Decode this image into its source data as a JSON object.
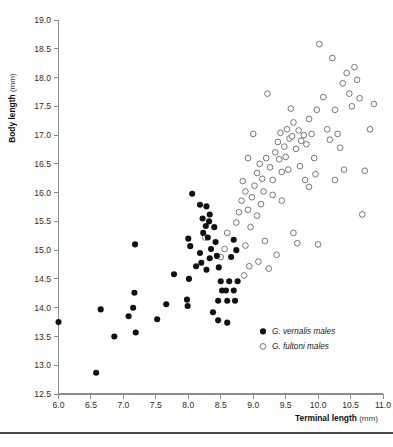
{
  "figure": {
    "background": "#ffffff",
    "point_color_filled": "#111111",
    "point_color_open_stroke": "#6f6f6f",
    "axis_color": "#8d8d8d"
  },
  "axes": {
    "y_title_bold": "Body length",
    "y_title_unit": "(mm)",
    "x_title_bold": "Terminal length",
    "x_title_unit": "(mm)",
    "y_ticks": [
      "19.0",
      "18.5",
      "18.0",
      "17.5",
      "17.0",
      "16.5",
      "16.0",
      "15.5",
      "15.0",
      "14.5",
      "14.0",
      "13.5",
      "13.0",
      "12.5"
    ],
    "x_ticks": [
      "6.0",
      "6.5",
      "7.0",
      "7.5",
      "8.0",
      "8.5",
      "9.0",
      "9.5",
      "10.0",
      "10.5",
      "11.0"
    ]
  },
  "legend": {
    "items": [
      {
        "marker": "filled-circle",
        "genus": "G. vernalis",
        "suffix": "males"
      },
      {
        "marker": "open-circle",
        "genus": "G. fultoni",
        "suffix": "males"
      }
    ]
  },
  "chart_data": {
    "type": "scatter",
    "title": "",
    "xlabel": "Terminal length (mm)",
    "ylabel": "Body length (mm)",
    "xlim": [
      6.0,
      11.0
    ],
    "ylim": [
      12.5,
      19.0
    ],
    "grid": false,
    "legend_position": "bottom-right",
    "series": [
      {
        "name": "G. vernalis males",
        "marker": "filled-circle",
        "points": [
          [
            6.0,
            13.75
          ],
          [
            6.58,
            12.87
          ],
          [
            6.65,
            13.97
          ],
          [
            6.86,
            13.5
          ],
          [
            7.08,
            13.85
          ],
          [
            7.15,
            14.0
          ],
          [
            7.17,
            14.26
          ],
          [
            7.18,
            15.1
          ],
          [
            7.19,
            13.57
          ],
          [
            7.52,
            13.8
          ],
          [
            7.66,
            14.06
          ],
          [
            7.78,
            14.58
          ],
          [
            7.98,
            14.14
          ],
          [
            7.99,
            14.03
          ],
          [
            8.01,
            14.5
          ],
          [
            8.0,
            15.2
          ],
          [
            8.03,
            15.07
          ],
          [
            8.06,
            15.98
          ],
          [
            8.18,
            15.79
          ],
          [
            8.28,
            15.76
          ],
          [
            8.22,
            15.55
          ],
          [
            8.27,
            15.42
          ],
          [
            8.23,
            15.3
          ],
          [
            8.18,
            14.95
          ],
          [
            8.2,
            14.78
          ],
          [
            8.12,
            14.72
          ],
          [
            8.33,
            15.62
          ],
          [
            8.32,
            15.5
          ],
          [
            8.3,
            15.22
          ],
          [
            8.35,
            15.02
          ],
          [
            8.33,
            14.86
          ],
          [
            8.28,
            14.66
          ],
          [
            8.4,
            15.4
          ],
          [
            8.42,
            15.14
          ],
          [
            8.44,
            14.9
          ],
          [
            8.47,
            14.7
          ],
          [
            8.5,
            14.46
          ],
          [
            8.52,
            14.3
          ],
          [
            8.46,
            14.12
          ],
          [
            8.58,
            14.3
          ],
          [
            8.6,
            14.12
          ],
          [
            8.63,
            14.46
          ],
          [
            8.7,
            14.3
          ],
          [
            8.72,
            14.12
          ],
          [
            8.76,
            14.46
          ],
          [
            8.38,
            13.92
          ],
          [
            8.46,
            13.78
          ],
          [
            8.6,
            13.74
          ],
          [
            8.74,
            15.0
          ],
          [
            8.7,
            15.18
          ],
          [
            8.66,
            14.88
          ]
        ]
      },
      {
        "name": "G. fultoni males",
        "marker": "open-circle",
        "points": [
          [
            8.26,
            15.22
          ],
          [
            8.56,
            15.02
          ],
          [
            8.5,
            14.88
          ],
          [
            8.6,
            15.3
          ],
          [
            8.74,
            15.48
          ],
          [
            8.78,
            15.66
          ],
          [
            8.82,
            15.86
          ],
          [
            8.88,
            16.02
          ],
          [
            8.84,
            16.2
          ],
          [
            8.92,
            15.7
          ],
          [
            8.98,
            15.92
          ],
          [
            9.02,
            16.12
          ],
          [
            9.06,
            16.34
          ],
          [
            9.1,
            16.5
          ],
          [
            9.14,
            16.24
          ],
          [
            9.16,
            16.02
          ],
          [
            9.12,
            15.8
          ],
          [
            9.2,
            16.6
          ],
          [
            9.26,
            16.44
          ],
          [
            9.3,
            16.22
          ],
          [
            9.34,
            16.7
          ],
          [
            9.38,
            16.88
          ],
          [
            9.42,
            17.04
          ],
          [
            9.4,
            16.58
          ],
          [
            9.44,
            16.36
          ],
          [
            9.48,
            16.8
          ],
          [
            9.52,
            17.1
          ],
          [
            9.56,
            16.94
          ],
          [
            9.5,
            16.62
          ],
          [
            9.54,
            16.4
          ],
          [
            9.58,
            17.46
          ],
          [
            9.62,
            17.22
          ],
          [
            9.6,
            16.98
          ],
          [
            9.66,
            16.76
          ],
          [
            9.7,
            17.08
          ],
          [
            9.74,
            16.9
          ],
          [
            9.78,
            17.0
          ],
          [
            9.82,
            16.84
          ],
          [
            9.86,
            17.28
          ],
          [
            9.9,
            17.02
          ],
          [
            9.94,
            16.6
          ],
          [
            9.96,
            16.32
          ],
          [
            10.02,
            18.58
          ],
          [
            10.08,
            17.66
          ],
          [
            10.14,
            17.1
          ],
          [
            10.18,
            16.92
          ],
          [
            10.22,
            18.34
          ],
          [
            10.3,
            17.02
          ],
          [
            10.34,
            16.78
          ],
          [
            10.38,
            17.9
          ],
          [
            10.44,
            18.08
          ],
          [
            10.48,
            17.72
          ],
          [
            10.52,
            17.5
          ],
          [
            10.56,
            18.18
          ],
          [
            10.6,
            17.96
          ],
          [
            10.64,
            17.64
          ],
          [
            10.68,
            15.62
          ],
          [
            10.72,
            16.38
          ],
          [
            10.8,
            17.1
          ],
          [
            10.86,
            17.54
          ],
          [
            9.22,
            17.72
          ],
          [
            9.0,
            17.02
          ],
          [
            8.92,
            16.6
          ],
          [
            9.98,
            17.44
          ],
          [
            10.26,
            17.44
          ],
          [
            9.3,
            15.96
          ],
          [
            9.44,
            15.86
          ],
          [
            9.06,
            15.6
          ],
          [
            8.96,
            15.4
          ],
          [
            9.18,
            15.16
          ],
          [
            9.62,
            15.3
          ],
          [
            9.68,
            15.12
          ],
          [
            10.0,
            15.1
          ],
          [
            9.36,
            14.92
          ],
          [
            8.88,
            15.08
          ],
          [
            8.94,
            14.72
          ],
          [
            9.08,
            14.8
          ],
          [
            9.24,
            14.68
          ],
          [
            8.86,
            14.56
          ],
          [
            10.26,
            16.22
          ],
          [
            10.4,
            16.4
          ],
          [
            9.86,
            16.1
          ],
          [
            9.72,
            16.46
          ],
          [
            9.8,
            16.22
          ]
        ]
      }
    ]
  }
}
